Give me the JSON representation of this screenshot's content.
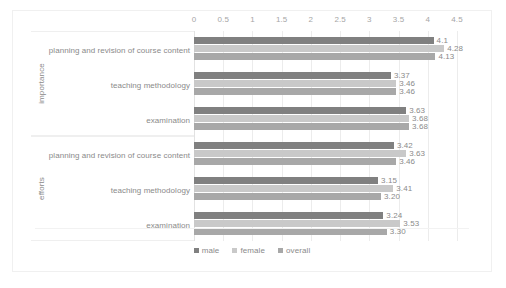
{
  "chart_data": {
    "type": "bar",
    "orientation": "horizontal",
    "title": "",
    "xlabel": "",
    "ylabel": "",
    "xlim": [
      0,
      4.5
    ],
    "xticks": [
      "0",
      "0.5",
      "1",
      "1.5",
      "2",
      "2.5",
      "3",
      "3.5",
      "4",
      "4.5"
    ],
    "grid": true,
    "legend_position": "bottom",
    "series": [
      {
        "name": "male",
        "color": "#808080"
      },
      {
        "name": "female",
        "color": "#c9c9c9"
      },
      {
        "name": "overall",
        "color": "#a8a8a8"
      }
    ],
    "groups": [
      {
        "name": "importance",
        "categories": [
          {
            "label": "planning and revision of course content",
            "values": [
              4.1,
              4.28,
              4.13
            ],
            "labels": [
              "4.1",
              "4.28",
              "4.13"
            ]
          },
          {
            "label": "teaching methodology",
            "values": [
              3.37,
              3.46,
              3.46
            ],
            "labels": [
              "3.37",
              "3.46",
              "3.46"
            ]
          },
          {
            "label": "examination",
            "values": [
              3.63,
              3.68,
              3.68
            ],
            "labels": [
              "3.63",
              "3.68",
              "3.68"
            ]
          }
        ]
      },
      {
        "name": "efforts",
        "categories": [
          {
            "label": "planning and revision of course content",
            "values": [
              3.42,
              3.63,
              3.46
            ],
            "labels": [
              "3.42",
              "3.63",
              "3.46"
            ]
          },
          {
            "label": "teaching methodology",
            "values": [
              3.15,
              3.41,
              3.2
            ],
            "labels": [
              "3.15",
              "3.41",
              "3.20"
            ]
          },
          {
            "label": "examination",
            "values": [
              3.24,
              3.53,
              3.3
            ],
            "labels": [
              "3.24",
              "3.53",
              "3.30"
            ]
          }
        ]
      }
    ]
  }
}
